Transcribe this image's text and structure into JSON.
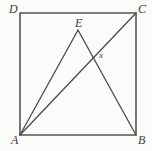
{
  "figure": {
    "kind": "plane-geometry-diagram",
    "canvas": {
      "width": 152,
      "height": 151
    },
    "colors": {
      "background": "#fbfbf9",
      "stroke": "#4a4a4a",
      "square_stroke": "#555555",
      "label": "#3c3c3c"
    },
    "stroke_widths": {
      "square": 1.6,
      "segment": 1.3
    },
    "points": {
      "A": {
        "label": "A",
        "x": 20,
        "y": 135
      },
      "B": {
        "label": "B",
        "x": 136,
        "y": 135
      },
      "C": {
        "label": "C",
        "x": 136,
        "y": 13
      },
      "D": {
        "label": "D",
        "x": 20,
        "y": 13
      },
      "E": {
        "label": "E",
        "x": 78,
        "y": 30
      },
      "X": {
        "label": "x",
        "x": 95,
        "y": 57
      }
    },
    "square_path": "M 20 13 L 136 13 L 136 135 L 20 135 Z",
    "segments": [
      {
        "name": "AE",
        "from": "A",
        "to": "E",
        "d": "M 20 135 L 78 30"
      },
      {
        "name": "EB",
        "from": "E",
        "to": "B",
        "d": "M 78 30 L 136 135"
      },
      {
        "name": "AC",
        "from": "A",
        "to": "C",
        "d": "M 20 135 L 136 13"
      }
    ],
    "labels": {
      "D": "D",
      "C": "C",
      "A": "A",
      "B": "B",
      "E": "E",
      "x": "x"
    }
  }
}
